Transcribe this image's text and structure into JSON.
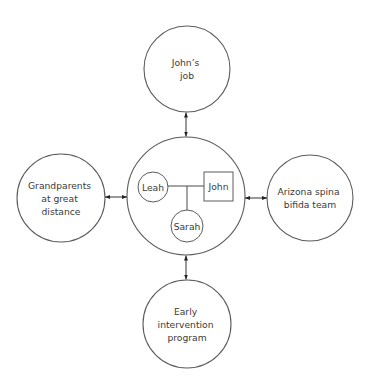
{
  "diagram": {
    "type": "ecomap",
    "center": {
      "members": [
        {
          "name": "Leah",
          "shape": "circle"
        },
        {
          "name": "John",
          "shape": "square"
        },
        {
          "name": "Sarah",
          "shape": "circle"
        }
      ]
    },
    "nodes": {
      "top": {
        "lines": [
          "John’s",
          "job"
        ]
      },
      "left": {
        "lines": [
          "Grandparents",
          "at great",
          "distance"
        ]
      },
      "right": {
        "lines": [
          "Arizona spina",
          "bifida team"
        ]
      },
      "bottom": {
        "lines": [
          "Early",
          "intervention",
          "program"
        ]
      }
    },
    "connections": [
      {
        "from": "center",
        "to": "top",
        "direction": "both"
      },
      {
        "from": "center",
        "to": "left",
        "direction": "both"
      },
      {
        "from": "center",
        "to": "right",
        "direction": "both"
      },
      {
        "from": "center",
        "to": "bottom",
        "direction": "both"
      }
    ]
  }
}
